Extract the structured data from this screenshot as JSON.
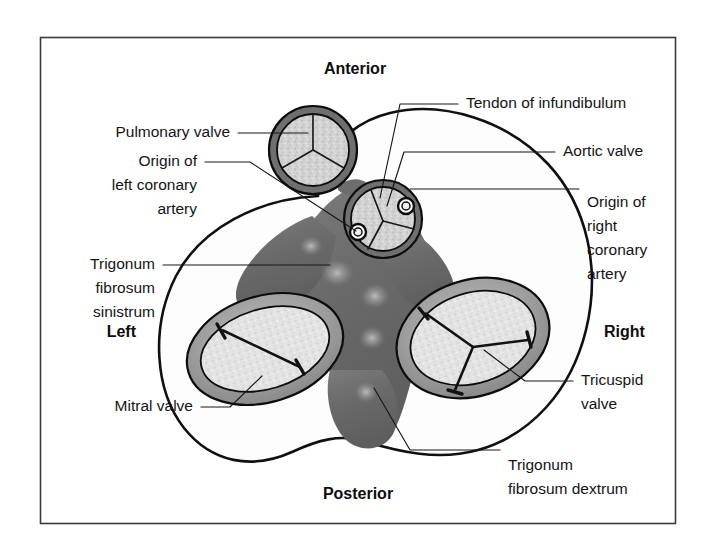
{
  "figure": {
    "frame": {
      "stroke_color": "#3a3a3a",
      "background": "#ffffff"
    }
  },
  "orientation_labels": [
    {
      "id": "anterior",
      "text": "Anterior",
      "x": 355,
      "y": 70,
      "anchor": "middle"
    },
    {
      "id": "posterior",
      "text": "Posterior",
      "x": 358,
      "y": 495,
      "anchor": "middle"
    },
    {
      "id": "left",
      "text": "Left",
      "x": 136,
      "y": 333,
      "anchor": "end"
    },
    {
      "id": "right",
      "text": "Right",
      "x": 604,
      "y": 333,
      "anchor": "start"
    }
  ],
  "structure_labels": [
    {
      "id": "pulmonary-valve",
      "lines": [
        "Pulmonary valve"
      ],
      "x": 230,
      "y": 133,
      "anchor": "end"
    },
    {
      "id": "origin-left-coronary-artery",
      "lines": [
        "Origin of",
        "left coronary",
        "artery"
      ],
      "x": 197,
      "y": 177,
      "anchor": "end"
    },
    {
      "id": "trigonum-fibrosum-sinistrum",
      "lines": [
        "Trigonum",
        "fibrosum",
        "sinistrum"
      ],
      "x": 155,
      "y": 265,
      "anchor": "end"
    },
    {
      "id": "mitral-valve",
      "lines": [
        "Mitral valve"
      ],
      "x": 193,
      "y": 407,
      "anchor": "end"
    },
    {
      "id": "tendon-of-infundibulum",
      "lines": [
        "Tendon of infundibulum"
      ],
      "x": 466,
      "y": 104,
      "anchor": "start"
    },
    {
      "id": "aortic-valve",
      "lines": [
        "Aortic valve"
      ],
      "x": 563,
      "y": 152,
      "anchor": "start"
    },
    {
      "id": "origin-right-coronary-artery",
      "lines": [
        "Origin of",
        "right",
        "coronary",
        "artery"
      ],
      "x": 587,
      "y": 203,
      "anchor": "start"
    },
    {
      "id": "tricuspid-valve",
      "lines": [
        "Tricuspid",
        "valve"
      ],
      "x": 581,
      "y": 389,
      "anchor": "start"
    },
    {
      "id": "trigonum-fibrosum-dextrum",
      "lines": [
        "Trigonum",
        "fibrosum dextrum"
      ],
      "x": 508,
      "y": 466,
      "anchor": "start"
    }
  ],
  "valves": [
    {
      "id": "pulmonary-valve-shape",
      "name": "Pulmonary valve",
      "type": "semilunar",
      "cusps": 3,
      "center": [
        313,
        150
      ],
      "radius": 44,
      "ostia": []
    },
    {
      "id": "aortic-valve-shape",
      "name": "Aortic valve",
      "type": "semilunar",
      "cusps": 3,
      "center": [
        383,
        219
      ],
      "radius": 39,
      "ostia": [
        {
          "id": "left-coronary-ostium",
          "center": [
            358,
            232
          ],
          "radius": 8
        },
        {
          "id": "right-coronary-ostium",
          "center": [
            406,
            206
          ],
          "radius": 8
        }
      ]
    },
    {
      "id": "mitral-valve-shape",
      "name": "Mitral valve",
      "type": "atrioventricular",
      "cusps": 2,
      "center": [
        265,
        349
      ],
      "rx": 80,
      "ry": 53,
      "rotation": -17
    },
    {
      "id": "tricuspid-valve-shape",
      "name": "Tricuspid valve",
      "type": "atrioventricular",
      "cusps": 3,
      "center": [
        473,
        338
      ],
      "rx": 78,
      "ry": 58,
      "rotation": -18
    }
  ],
  "fibrous_regions": [
    {
      "id": "trigonum-fibrosum-sinistrum-region",
      "name": "Trigonum fibrosum sinistrum"
    },
    {
      "id": "trigonum-fibrosum-dextrum-region",
      "name": "Trigonum fibrosum dextrum"
    },
    {
      "id": "tendon-of-infundibulum-region",
      "name": "Tendon of infundibulum"
    }
  ],
  "colors": {
    "ink": "#141414",
    "frame_stroke": "#3a3a3a",
    "fibrous_body_dark": "#6e6e6e",
    "annulus_gray": "#9b9b9b",
    "leaflet_fill": "#d8d8d8",
    "cusp_fill": "#cfcfcf",
    "page_background": "#ffffff"
  }
}
